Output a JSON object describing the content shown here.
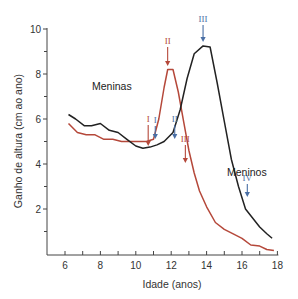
{
  "chart_data": {
    "type": "line",
    "title": "",
    "xlabel": "Idade (anos)",
    "ylabel": "Ganho de altura (cm ao ano)",
    "xlim": [
      5,
      18
    ],
    "ylim": [
      0,
      10
    ],
    "x_ticks": [
      6,
      8,
      10,
      12,
      14,
      16,
      18
    ],
    "x_minor_ticks": [
      7,
      9,
      11,
      13,
      15,
      17
    ],
    "y_ticks": [
      2,
      4,
      6,
      8,
      10
    ],
    "y_minor_ticks": [
      1,
      3,
      5,
      7,
      9
    ],
    "grid": false,
    "legend": "inline labels",
    "series": [
      {
        "name": "Meninas",
        "color": "#b5483a",
        "x": [
          6.2,
          6.7,
          7.2,
          7.7,
          8.2,
          8.7,
          9.2,
          9.7,
          10.2,
          10.6,
          11.0,
          11.3,
          11.6,
          11.8,
          12.1,
          12.4,
          12.7,
          13.0,
          13.3,
          13.6,
          14.0,
          14.5,
          15.0,
          15.5,
          16.0,
          16.5,
          17.0,
          17.4,
          17.8
        ],
        "values": [
          5.8,
          5.4,
          5.3,
          5.3,
          5.1,
          5.1,
          5.0,
          5.0,
          5.0,
          5.0,
          5.1,
          6.0,
          7.4,
          8.2,
          8.2,
          7.2,
          5.9,
          4.6,
          3.6,
          2.8,
          2.1,
          1.4,
          1.1,
          0.9,
          0.7,
          0.4,
          0.35,
          0.2,
          0.15
        ]
      },
      {
        "name": "Meninos",
        "color": "#222222",
        "x": [
          6.2,
          6.6,
          7.1,
          7.5,
          8.0,
          8.5,
          9.0,
          9.5,
          10.0,
          10.4,
          10.8,
          11.2,
          11.6,
          12.1,
          12.5,
          12.9,
          13.3,
          13.8,
          14.2,
          14.6,
          15.0,
          15.4,
          15.8,
          16.2,
          16.6,
          17.0,
          17.4,
          17.7
        ],
        "values": [
          6.2,
          6.0,
          5.7,
          5.7,
          5.8,
          5.5,
          5.4,
          5.1,
          4.8,
          4.7,
          4.75,
          4.85,
          5.0,
          5.4,
          6.4,
          7.8,
          8.9,
          9.25,
          9.2,
          7.6,
          5.9,
          4.2,
          3.0,
          2.0,
          1.6,
          1.2,
          0.9,
          0.7
        ]
      }
    ],
    "annotations": [
      {
        "text": "I",
        "series": "Meninas",
        "x": 10.7,
        "color": "#b5483a"
      },
      {
        "text": "II",
        "series": "Meninas",
        "x": 11.8,
        "color": "#b5483a"
      },
      {
        "text": "III",
        "series": "Meninas",
        "x": 12.8,
        "color": "#b5483a"
      },
      {
        "text": "I",
        "series": "Meninos",
        "x": 11.1,
        "color": "#4a6fa5"
      },
      {
        "text": "II",
        "series": "Meninos",
        "x": 12.2,
        "color": "#4a6fa5"
      },
      {
        "text": "III",
        "series": "Meninos",
        "x": 13.8,
        "color": "#4a6fa5"
      },
      {
        "text": "IV",
        "series": "Meninos",
        "x": 16.3,
        "color": "#4a6fa5"
      }
    ]
  },
  "labels": {
    "girls": "Meninas",
    "boys": "Meninos",
    "xlabel": "Idade (anos)",
    "ylabel": "Ganho de altura (cm ao ano)"
  }
}
